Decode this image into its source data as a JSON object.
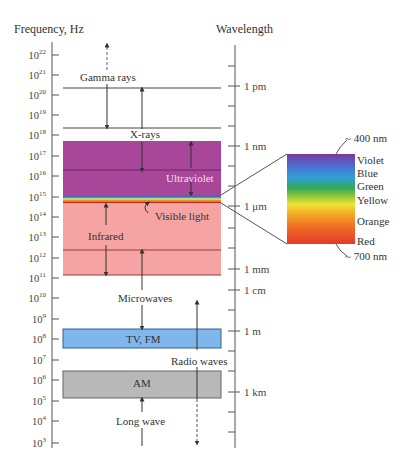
{
  "left_axis": {
    "title": "Frequency, Hz",
    "ticks": [
      {
        "base": "10",
        "exp": "22",
        "y": 55
      },
      {
        "base": "10",
        "exp": "21",
        "y": 75
      },
      {
        "base": "10",
        "exp": "20",
        "y": 95
      },
      {
        "base": "10",
        "exp": "19",
        "y": 115
      },
      {
        "base": "10",
        "exp": "18",
        "y": 135
      },
      {
        "base": "10",
        "exp": "17",
        "y": 156
      },
      {
        "base": "10",
        "exp": "16",
        "y": 176
      },
      {
        "base": "10",
        "exp": "15",
        "y": 197
      },
      {
        "base": "10",
        "exp": "14",
        "y": 217
      },
      {
        "base": "10",
        "exp": "13",
        "y": 237
      },
      {
        "base": "10",
        "exp": "12",
        "y": 258
      },
      {
        "base": "10",
        "exp": "11",
        "y": 278
      },
      {
        "base": "10",
        "exp": "10",
        "y": 298
      },
      {
        "base": "10",
        "exp": "9",
        "y": 319
      },
      {
        "base": "10",
        "exp": "8",
        "y": 339
      },
      {
        "base": "10",
        "exp": "7",
        "y": 360
      },
      {
        "base": "10",
        "exp": "6",
        "y": 380
      },
      {
        "base": "10",
        "exp": "5",
        "y": 401
      },
      {
        "base": "10",
        "exp": "4",
        "y": 421
      },
      {
        "base": "10",
        "exp": "3",
        "y": 443
      }
    ]
  },
  "right_axis": {
    "title": "Wavelength",
    "labels": [
      {
        "text": "1 pm",
        "y": 86
      },
      {
        "text": "1 nm",
        "y": 146
      },
      {
        "text": "1 μm",
        "y": 206
      },
      {
        "text": "1 mm",
        "y": 269
      },
      {
        "text": "1 cm",
        "y": 290
      },
      {
        "text": "1 m",
        "y": 331
      },
      {
        "text": "1 km",
        "y": 392
      }
    ]
  },
  "bands": [
    {
      "name": "Gamma rays",
      "label": "Gamma rays"
    },
    {
      "name": "X-rays",
      "label": "X-rays"
    },
    {
      "name": "Ultraviolet",
      "label": "Ultraviolet",
      "color": "#a8479a"
    },
    {
      "name": "Visible light",
      "label": "Visible light"
    },
    {
      "name": "Infrared",
      "label": "Infrared",
      "color": "#f5a3a3"
    },
    {
      "name": "Microwaves",
      "label": "Microwaves"
    },
    {
      "name": "TV, FM",
      "label": "TV, FM",
      "color": "#7fb6ec"
    },
    {
      "name": "Radio waves",
      "label": "Radio waves"
    },
    {
      "name": "AM",
      "label": "AM",
      "color": "#b8b8b8"
    },
    {
      "name": "Long wave",
      "label": "Long wave"
    }
  ],
  "spectrum": {
    "top_label": "~ 400 nm",
    "bottom_label": "~ 700 nm",
    "colors": [
      {
        "label": "Violet"
      },
      {
        "label": "Blue"
      },
      {
        "label": "Green"
      },
      {
        "label": "Yellow"
      },
      {
        "label": "Orange"
      },
      {
        "label": "Red"
      }
    ]
  }
}
